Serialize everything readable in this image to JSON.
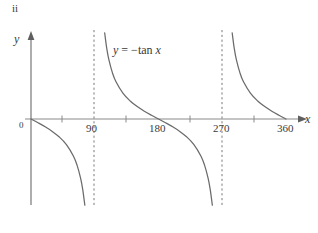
{
  "figure": {
    "part_label": "ii",
    "background": "#ffffff",
    "ink_color": "#6b6b6b",
    "text_color": "#3a3a3a"
  },
  "axes": {
    "y_label": "y",
    "x_label": "x",
    "origin_label": "0"
  },
  "annotations": {
    "curve_equation_lhs": "y",
    "curve_equation_eq": " = ",
    "curve_equation_fn": "−tan ",
    "curve_equation_var": "x",
    "curve_equation_full": "y = −tan x"
  },
  "chart_data": {
    "type": "line",
    "title": "ii",
    "function": "y = -tan x",
    "xlabel": "x",
    "ylabel": "y",
    "xlim": [
      0,
      390
    ],
    "ylim": [
      -4.2,
      4.2
    ],
    "grid": false,
    "legend": null,
    "x_tick_labels": [
      "0",
      "90",
      "180",
      "270",
      "360"
    ],
    "x_tick_values": [
      0,
      90,
      180,
      270,
      360
    ],
    "x_minor_tick_values": [
      45,
      135,
      225,
      315
    ],
    "y_tick_labels": [],
    "asymptotes": [
      90,
      270
    ],
    "asymptote_style": "dashed",
    "branches": [
      {
        "name": "branch-0-to-90",
        "x_range": [
          0,
          90
        ],
        "points": [
          {
            "x": 0,
            "y": 0
          },
          {
            "x": 10,
            "y": -0.176
          },
          {
            "x": 20,
            "y": -0.364
          },
          {
            "x": 30,
            "y": -0.577
          },
          {
            "x": 40,
            "y": -0.839
          },
          {
            "x": 50,
            "y": -1.192
          },
          {
            "x": 60,
            "y": -1.732
          },
          {
            "x": 65,
            "y": -2.145
          },
          {
            "x": 70,
            "y": -2.747
          },
          {
            "x": 73,
            "y": -3.271
          },
          {
            "x": 76,
            "y": -4.011
          }
        ]
      },
      {
        "name": "branch-90-to-270",
        "x_range": [
          90,
          270
        ],
        "points": [
          {
            "x": 104,
            "y": 4.011
          },
          {
            "x": 107,
            "y": 3.271
          },
          {
            "x": 110,
            "y": 2.747
          },
          {
            "x": 115,
            "y": 2.145
          },
          {
            "x": 120,
            "y": 1.732
          },
          {
            "x": 130,
            "y": 1.192
          },
          {
            "x": 140,
            "y": 0.839
          },
          {
            "x": 150,
            "y": 0.577
          },
          {
            "x": 160,
            "y": 0.364
          },
          {
            "x": 170,
            "y": 0.176
          },
          {
            "x": 180,
            "y": 0
          },
          {
            "x": 190,
            "y": -0.176
          },
          {
            "x": 200,
            "y": -0.364
          },
          {
            "x": 210,
            "y": -0.577
          },
          {
            "x": 220,
            "y": -0.839
          },
          {
            "x": 230,
            "y": -1.192
          },
          {
            "x": 240,
            "y": -1.732
          },
          {
            "x": 245,
            "y": -2.145
          },
          {
            "x": 250,
            "y": -2.747
          },
          {
            "x": 253,
            "y": -3.271
          },
          {
            "x": 256,
            "y": -4.011
          }
        ]
      },
      {
        "name": "branch-270-to-360",
        "x_range": [
          270,
          360
        ],
        "points": [
          {
            "x": 284,
            "y": 4.011
          },
          {
            "x": 287,
            "y": 3.271
          },
          {
            "x": 290,
            "y": 2.747
          },
          {
            "x": 295,
            "y": 2.145
          },
          {
            "x": 300,
            "y": 1.732
          },
          {
            "x": 310,
            "y": 1.192
          },
          {
            "x": 320,
            "y": 0.839
          },
          {
            "x": 330,
            "y": 0.577
          },
          {
            "x": 340,
            "y": 0.364
          },
          {
            "x": 350,
            "y": 0.176
          },
          {
            "x": 360,
            "y": 0
          }
        ]
      }
    ]
  }
}
